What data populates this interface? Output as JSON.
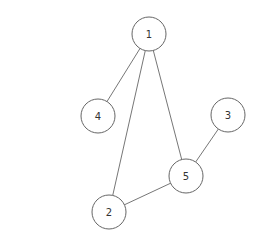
{
  "graph": {
    "node_radius": 17,
    "colors": {
      "stroke": "#666666",
      "fill": "#ffffff",
      "text": "#333333"
    },
    "nodes": [
      {
        "id": "1",
        "label": "1",
        "x": 149,
        "y": 34
      },
      {
        "id": "2",
        "label": "2",
        "x": 109,
        "y": 212
      },
      {
        "id": "3",
        "label": "3",
        "x": 228,
        "y": 115
      },
      {
        "id": "4",
        "label": "4",
        "x": 98,
        "y": 116
      },
      {
        "id": "5",
        "label": "5",
        "x": 186,
        "y": 176
      }
    ],
    "edges": [
      {
        "from": "1",
        "to": "4"
      },
      {
        "from": "1",
        "to": "2"
      },
      {
        "from": "1",
        "to": "5"
      },
      {
        "from": "5",
        "to": "3"
      },
      {
        "from": "5",
        "to": "2"
      }
    ]
  }
}
